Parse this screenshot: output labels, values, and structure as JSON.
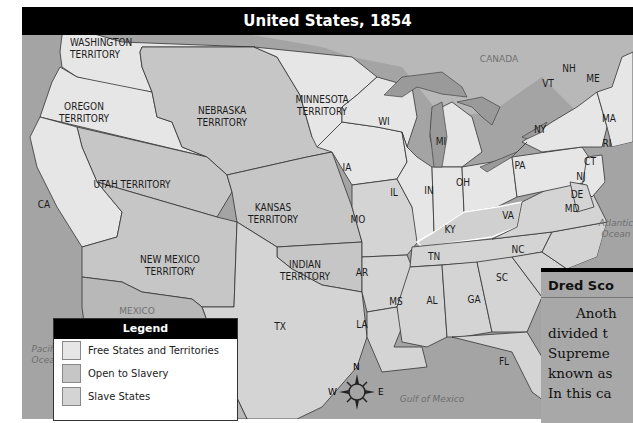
{
  "title": "United States, 1854",
  "colors": {
    "free": "#e6e6e6",
    "open_to_slavery": "#c6c6c6",
    "slave": "#d4d4d4",
    "water": "#a4a4a4",
    "foreign": "#b6b6b6",
    "title_bg": "#000000"
  },
  "regions": {
    "washington": "WASHINGTON\nTERRITORY",
    "oregon": "OREGON\nTERRITORY",
    "nebraska": "NEBRASKA\nTERRITORY",
    "minnesota": "MINNESOTA\nTERRITORY",
    "utah": "UTAH TERRITORY",
    "kansas": "KANSAS\nTERRITORY",
    "new_mexico": "NEW MEXICO\nTERRITORY",
    "indian": "INDIAN\nTERRITORY",
    "ca": "CA",
    "tx": "TX",
    "ia": "IA",
    "mo": "MO",
    "ar": "AR",
    "la": "LA",
    "wi": "WI",
    "mi": "MI",
    "il": "IL",
    "in": "IN",
    "oh": "OH",
    "ky": "KY",
    "tn": "TN",
    "ms": "MS",
    "al": "AL",
    "ga": "GA",
    "fl": "FL",
    "sc": "SC",
    "nc": "NC",
    "va": "VA",
    "pa": "PA",
    "ny": "NY",
    "vt": "VT",
    "nh": "NH",
    "me": "ME",
    "ma": "MA",
    "ri": "RI",
    "ct": "CT",
    "nj": "NJ",
    "de": "DE",
    "md": "MD"
  },
  "places": {
    "canada": "CANADA",
    "mexico": "MEXICO",
    "pacific": "Pacific\nOcean",
    "atlantic": "Atlantic\nOcean",
    "gulf": "Gulf of Mexico"
  },
  "compass": {
    "n": "N",
    "s": "S",
    "e": "E",
    "w": "W"
  },
  "legend": {
    "title": "Legend",
    "items": [
      {
        "label": "Free States and Territories",
        "color": "#e6e6e6"
      },
      {
        "label": "Open to Slavery",
        "color": "#c6c6c6"
      },
      {
        "label": "Slave States",
        "color": "#d4d4d4"
      }
    ]
  },
  "sidebar": {
    "title": "Dred Sco",
    "lines": [
      "Anoth",
      "divided t",
      "Supreme",
      "known as",
      "In this ca"
    ]
  }
}
